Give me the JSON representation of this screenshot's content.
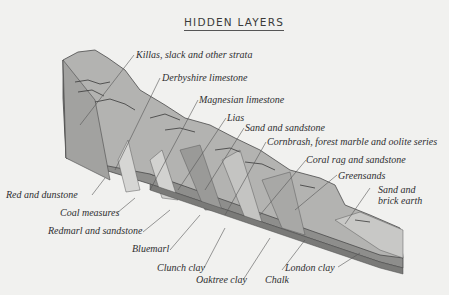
{
  "title": "HIDDEN LAYERS",
  "colors": {
    "background": "#f1f1ef",
    "strata_light": "#c9c9c7",
    "strata_mid": "#a9a9a7",
    "strata_dark": "#8e8e8c",
    "outline": "#4a4a4a",
    "text": "#2f2f2f"
  },
  "labels": [
    {
      "id": "killas",
      "text": "Killas, slack and other strata"
    },
    {
      "id": "derbyshire",
      "text": "Derbyshire limestone"
    },
    {
      "id": "magnesian",
      "text": "Magnesian limestone"
    },
    {
      "id": "lias",
      "text": "Lias"
    },
    {
      "id": "sand-sandstone",
      "text": "Sand and sandstone"
    },
    {
      "id": "cornbrash",
      "text": "Cornbrash, forest marble and oolite series"
    },
    {
      "id": "coral-rag",
      "text": "Coral rag and sandstone"
    },
    {
      "id": "greensands",
      "text": "Greensands"
    },
    {
      "id": "sand-brick-1",
      "text": "Sand and"
    },
    {
      "id": "sand-brick-2",
      "text": "brick earth"
    },
    {
      "id": "red-dunstone",
      "text": "Red and dunstone"
    },
    {
      "id": "coal",
      "text": "Coal measures"
    },
    {
      "id": "redmarl",
      "text": "Redmarl and sandstone"
    },
    {
      "id": "bluemarl",
      "text": "Bluemarl"
    },
    {
      "id": "clunch",
      "text": "Clunch clay"
    },
    {
      "id": "oaktree",
      "text": "Oaktree clay"
    },
    {
      "id": "chalk",
      "text": "Chalk"
    },
    {
      "id": "london",
      "text": "London clay"
    }
  ]
}
